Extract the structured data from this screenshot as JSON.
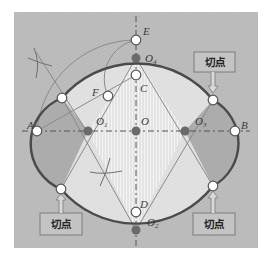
{
  "diagram": {
    "title": "",
    "colors": {
      "frame_bg": "#bdbdbd",
      "outer_lens": "#a9a9a9",
      "inner_light": "#e6e6e6",
      "stripe": "#f2f2f2",
      "ellipse_stroke": "#4a4a4a",
      "thin_line": "#7a7a7a",
      "center_dot": "#6a6a6a",
      "tag_bg": "#c4c4c4",
      "tag_border": "#7c7c7c"
    },
    "points": {
      "A": {
        "label": "A",
        "x": 37,
        "y": 131
      },
      "B": {
        "label": "B",
        "x": 235,
        "y": 131
      },
      "C": {
        "label": "C",
        "x": 136,
        "y": 75
      },
      "D": {
        "label": "D",
        "x": 136,
        "y": 212
      },
      "E": {
        "label": "E",
        "x": 136,
        "y": 40
      },
      "F": {
        "label": "F",
        "x": 108,
        "y": 96
      },
      "O": {
        "label": "O",
        "x": 136,
        "y": 131
      },
      "O1": {
        "label": "O",
        "sub": "1",
        "x": 88,
        "y": 131
      },
      "O2": {
        "label": "O",
        "sub": "2",
        "x": 136,
        "y": 230
      },
      "O3": {
        "label": "O",
        "sub": "3",
        "x": 185,
        "y": 131
      },
      "O4": {
        "label": "O",
        "sub": "4",
        "x": 136,
        "y": 58
      }
    },
    "tangent_points": [
      {
        "x": 62,
        "y": 98
      },
      {
        "x": 213,
        "y": 100
      },
      {
        "x": 61,
        "y": 189
      },
      {
        "x": 213,
        "y": 186
      }
    ],
    "tags": [
      {
        "text": "切点",
        "position": "top-right"
      },
      {
        "text": "切点",
        "position": "bottom-left"
      },
      {
        "text": "切点",
        "position": "bottom-right"
      }
    ]
  }
}
